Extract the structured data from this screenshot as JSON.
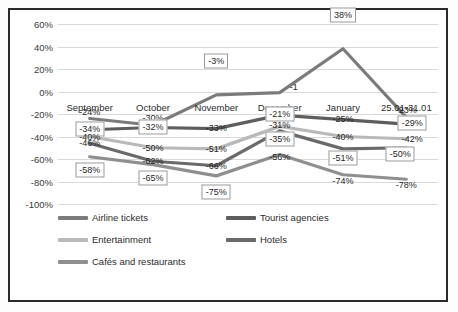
{
  "chart_data": {
    "type": "line",
    "title": "",
    "subtitle": "",
    "xlabel": "",
    "ylabel": "",
    "categories": [
      "September",
      "October",
      "November",
      "December",
      "January",
      "25.01-31.01"
    ],
    "ylim": [
      -100,
      60
    ],
    "ytick_labels": [
      "60%",
      "40%",
      "20%",
      "0%",
      "-20%",
      "-40%",
      "-60%",
      "-80%",
      "-100%"
    ],
    "ytick_values": [
      60,
      40,
      20,
      0,
      -20,
      -40,
      -60,
      -80,
      -100
    ],
    "grid": true,
    "legend_position": "bottom",
    "series": [
      {
        "name": "Airline tickets",
        "color": "#7b7b7b",
        "values": [
          -24,
          -30,
          -3,
          -1,
          38,
          -23
        ],
        "labels": [
          "-24%",
          "-30%",
          "-3%",
          "-1",
          "38%",
          "-23%"
        ],
        "boxed": [
          false,
          false,
          true,
          false,
          true,
          false
        ]
      },
      {
        "name": "Tourist agencies",
        "color": "#5e5e5e",
        "values": [
          -34,
          -32,
          -33,
          -21,
          -25,
          -29
        ],
        "labels": [
          "-34%",
          "-32%",
          "-33%",
          "-21%",
          "-25%",
          "-29%"
        ],
        "boxed": [
          true,
          true,
          false,
          true,
          false,
          true
        ]
      },
      {
        "name": "Entertainment",
        "color": "#b9b9b9",
        "values": [
          -40,
          -50,
          -51,
          -31,
          -40,
          -42
        ],
        "labels": [
          "-40%",
          "-50%",
          "-51%",
          "-31%",
          "-40%",
          "-42%"
        ],
        "boxed": [
          false,
          false,
          false,
          false,
          false,
          false
        ]
      },
      {
        "name": "Hotels",
        "color": "#6a6a6a",
        "values": [
          -46,
          -62,
          -66,
          -35,
          -51,
          -50
        ],
        "labels": [
          "-46%",
          "-62%",
          "-66%",
          "-35%",
          "-51%",
          "-50%"
        ],
        "boxed": [
          false,
          false,
          false,
          true,
          true,
          true
        ]
      },
      {
        "name": "Cafés and restaurants",
        "color": "#8f8f8f",
        "values": [
          -58,
          -65,
          -75,
          -56,
          -74,
          -78
        ],
        "labels": [
          "-58%",
          "-65%",
          "-75%",
          "-56%",
          "-74%",
          "-78%"
        ],
        "boxed": [
          true,
          true,
          true,
          false,
          false,
          false
        ]
      }
    ]
  },
  "colors": {
    "frame_border": "#2b2b2b",
    "plot_background": "#ffffff",
    "gridline": "#d9d9d9",
    "text": "#2b2b2b"
  }
}
